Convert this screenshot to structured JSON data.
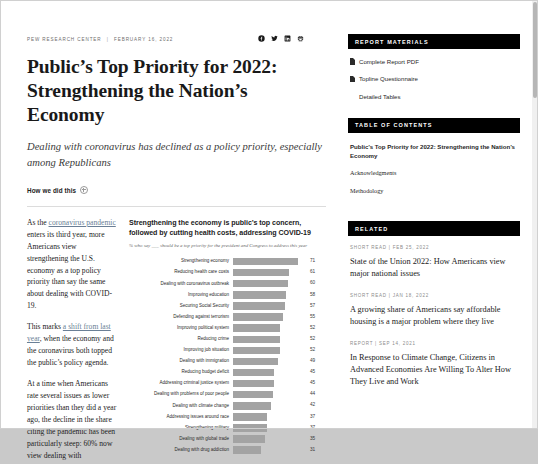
{
  "article": {
    "source": "PEW RESEARCH CENTER",
    "separator": "|",
    "date": "FEBRUARY 16, 2022",
    "headline_line1": "Public’s Top Priority for 2022:",
    "headline_line2": "Strengthening the Nation’s Economy",
    "subhead": "Dealing with coronavirus has declined as a policy priority, especially among Republicans",
    "how_we_did_this": "How we did this",
    "share_icons": [
      "facebook-icon",
      "twitter-icon",
      "linkedin-icon",
      "print-icon"
    ],
    "paragraphs": [
      {
        "pre": "As the ",
        "link": "coronavirus pandemic",
        "post": " enters its third year, more Americans view strengthening the U.S. economy as a top policy priority than say the same about dealing with COVID-19."
      },
      {
        "pre": "This marks ",
        "link": "a shift from last year",
        "post": ", when the economy and the coronavirus both topped the public’s policy agenda."
      },
      {
        "pre": "",
        "link": "",
        "post": "At a time when Americans rate several issues as lower priorities than they did a year ago, the decline in the share citing the pandemic has been particularly steep: 60% now view dealing with"
      }
    ]
  },
  "chart_data": {
    "type": "bar",
    "title": "Strengthening the economy is public’s top concern, followed by cutting health costs, addressing COVID-19",
    "subtitle": "% who say ___ should be a top priority for the president and Congress to address this year",
    "xlabel": "",
    "ylabel": "",
    "xlim": [
      0,
      80
    ],
    "grid": false,
    "legend": "none",
    "orientation": "horizontal",
    "categories": [
      "Strengthening economy",
      "Reducing health care costs",
      "Dealing with coronavirus outbreak",
      "Improving education",
      "Securing Social Security",
      "Defending against terrorism",
      "Improving political system",
      "Reducing crime",
      "Improving job situation",
      "Dealing with immigration",
      "Reducing budget deficit",
      "Addressing criminal justice system",
      "Dealing with problems of poor people",
      "Dealing with climate change",
      "Addressing issues around race",
      "Strengthening military",
      "Dealing with global trade",
      "Dealing with drug addiction"
    ],
    "values": [
      71,
      61,
      60,
      58,
      57,
      55,
      52,
      52,
      52,
      49,
      45,
      45,
      44,
      42,
      37,
      37,
      35,
      31
    ],
    "bar_color": "#a3a3a3"
  },
  "sidebar": {
    "report_materials": {
      "heading": "REPORT MATERIALS",
      "items": [
        {
          "label": "Complete Report PDF",
          "icon": "pdf-document-icon"
        },
        {
          "label": "Topline Questionnaire",
          "icon": "document-icon"
        },
        {
          "label": "Detailed Tables",
          "icon": "none"
        }
      ]
    },
    "table_of_contents": {
      "heading": "TABLE OF CONTENTS",
      "items": [
        {
          "label": "Public’s Top Priority for 2022: Strengthening the Nation’s Economy",
          "current": true
        },
        {
          "label": "Acknowledgments",
          "current": false
        },
        {
          "label": "Methodology",
          "current": false
        }
      ]
    },
    "related": {
      "heading": "RELATED",
      "items": [
        {
          "meta": "SHORT READ | FEB 25, 2022",
          "title": "State of the Union 2022: How Americans view major national issues"
        },
        {
          "meta": "SHORT READ | JAN 18, 2022",
          "title": "A growing share of Americans say affordable housing is a major problem where they live"
        },
        {
          "meta": "REPORT | SEP 14, 2021",
          "title": "In Response to Climate Change, Citizens in Advanced Economies Are Willing To Alter How They Live and Work"
        }
      ]
    }
  }
}
